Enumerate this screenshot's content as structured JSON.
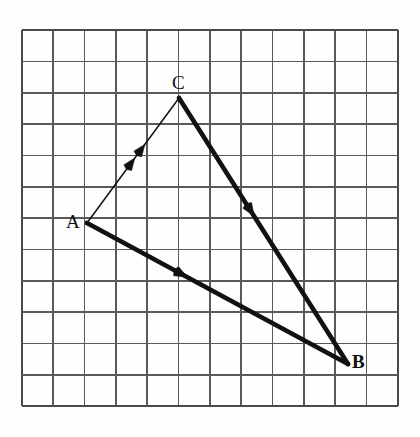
{
  "figure": {
    "kind": "vector-triangle-on-grid",
    "background_color": "#fefefe",
    "grid": {
      "origin_x": 21.7,
      "origin_y": 30,
      "cell": 31.35,
      "cols": 12,
      "rows": 12,
      "line_color": "#595959",
      "line_width": 1.6,
      "border_color": "#4a4a4a",
      "border_width": 2
    },
    "stroke_color": "#111111",
    "points": [
      {
        "name": "A",
        "label": "A",
        "x": 87,
        "y": 223,
        "grid_col": 2,
        "grid_row": 6
      },
      {
        "name": "B",
        "label": "B",
        "x": 348,
        "y": 364,
        "grid_col": 10.4,
        "grid_row": 10.65
      },
      {
        "name": "C",
        "label": "C",
        "x": 179,
        "y": 98,
        "grid_col": 5,
        "grid_row": 2.17
      }
    ],
    "vectors": [
      {
        "name": "vector-AC",
        "from": "A",
        "to": "C",
        "x1": 87,
        "y1": 223,
        "x2": 179,
        "y2": 98,
        "weight": "thin",
        "stroke_width": 1.5,
        "arrowheads": 2,
        "arrow_positions": [
          0.52,
          0.63
        ],
        "arrow_size": 12
      },
      {
        "name": "vector-AB",
        "from": "A",
        "to": "B",
        "x1": 87,
        "y1": 223,
        "x2": 348,
        "y2": 364,
        "weight": "thick",
        "stroke_width": 4.6,
        "arrowheads": 1,
        "arrow_positions": [
          0.385
        ],
        "arrow_size": 13
      },
      {
        "name": "vector-CB",
        "from": "C",
        "to": "B",
        "x1": 179,
        "y1": 98,
        "x2": 348,
        "y2": 364,
        "weight": "thick",
        "stroke_width": 4.6,
        "arrowheads": 1,
        "arrow_positions": [
          0.445
        ],
        "arrow_size": 13
      }
    ]
  }
}
